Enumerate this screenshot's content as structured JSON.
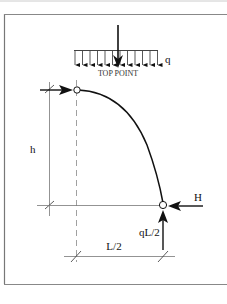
{
  "diagram": {
    "type": "three-hinged arch half-span free body",
    "labels": {
      "distributed_load": "q",
      "top_point": "TOP POINT",
      "height": "h",
      "half_span": "L/2",
      "horizontal_reaction": "H",
      "vertical_reaction": "qL/2"
    },
    "colors": {
      "line": "#111111",
      "dimension": "#666666",
      "frame": "#777777",
      "background": "#ffffff"
    },
    "elements": {
      "load_arrow_count": 12,
      "hinges": [
        "top-hinge",
        "support-hinge"
      ]
    }
  }
}
